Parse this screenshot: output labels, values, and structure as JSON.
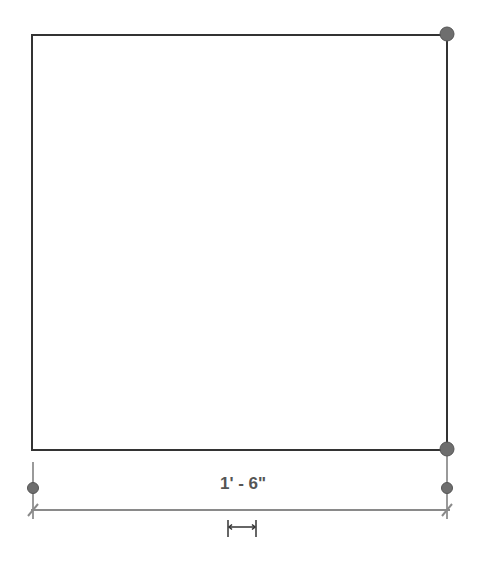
{
  "canvas": {
    "width": 501,
    "height": 562,
    "background": "#ffffff"
  },
  "shape": {
    "type": "rectangle",
    "x1": 32,
    "y1": 35,
    "x2": 447,
    "y2": 450,
    "stroke": "#333333"
  },
  "grips": [
    {
      "name": "corner-grip-top-right",
      "cx": 447,
      "cy": 34,
      "r": 7
    },
    {
      "name": "corner-grip-bottom-right",
      "cx": 447,
      "cy": 449,
      "r": 7
    }
  ],
  "dimension": {
    "label": "1' - 6\"",
    "color": "#8a8a8a",
    "text_color": "#555555",
    "left_x": 33,
    "right_x": 447,
    "line_y": 510,
    "witness_top": 462,
    "witness_bottom": 518,
    "grip_y": 488,
    "grip_r": 5,
    "flip_control_icon": "flip-arrows-icon"
  },
  "colors": {
    "grip_fill": "#6e6e6e",
    "grip_stroke": "#555555"
  }
}
